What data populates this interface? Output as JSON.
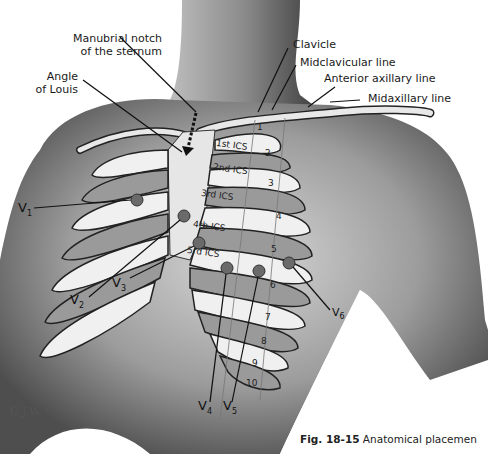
{
  "figure": {
    "caption_number": "Fig. 18-15",
    "caption_text": "Anatomical placemen",
    "signature": "G.J.W."
  },
  "labels": {
    "manubrial_notch": [
      "Manubrial notch",
      "of the sternum"
    ],
    "angle_of_louis": [
      "Angle",
      "of Louis"
    ],
    "clavicle": "Clavicle",
    "midclavicular_line": "Midclavicular line",
    "anterior_axillary_line": "Anterior axillary line",
    "midaxillary_line": "Midaxillary line"
  },
  "intercostal_spaces": [
    "1st ICS",
    "2nd ICS",
    "3rd ICS",
    "4th ICS",
    "5rd ICS"
  ],
  "rib_numbers": [
    "1",
    "2",
    "3",
    "4",
    "5",
    "6",
    "7",
    "8",
    "9",
    "10"
  ],
  "leads": [
    {
      "name": "V",
      "sub": "1"
    },
    {
      "name": "V",
      "sub": "2"
    },
    {
      "name": "V",
      "sub": "3"
    },
    {
      "name": "V",
      "sub": "4"
    },
    {
      "name": "V",
      "sub": "5"
    },
    {
      "name": "V",
      "sub": "6"
    }
  ],
  "colors": {
    "skin_dark": "#6e6e6e",
    "skin_mid": "#a8a8a8",
    "rib_light": "#f2f2f2",
    "ics_gray": "#9a9a9a",
    "electrode": "#6a6a6a",
    "line": "#111111"
  }
}
